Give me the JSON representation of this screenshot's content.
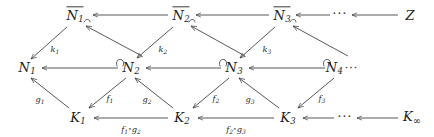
{
  "diagram": {
    "kind": "commutative-diagram",
    "stroke_color": "#3a3a3a",
    "text_color": "#1c1c1c",
    "background": "#ffffff",
    "ellipsis": "···",
    "trailing_ellipsis": "···",
    "compose_symbol": "∘"
  },
  "nodes": {
    "top": [
      {
        "base": "N",
        "sub": "1",
        "overline": true,
        "x": 75,
        "y": 15
      },
      {
        "base": "N",
        "sub": "2",
        "overline": true,
        "x": 181,
        "y": 15
      },
      {
        "base": "N",
        "sub": "3",
        "overline": true,
        "x": 282,
        "y": 15
      },
      {
        "base": "Z",
        "sub": "",
        "overline": false,
        "x": 410,
        "y": 15
      }
    ],
    "middle": [
      {
        "base": "N",
        "sub": "1",
        "x": 27,
        "y": 68
      },
      {
        "base": "N",
        "sub": "2",
        "x": 131,
        "y": 68
      },
      {
        "base": "N",
        "sub": "3",
        "x": 234,
        "y": 68
      },
      {
        "base": "N",
        "sub": "4",
        "x": 338,
        "y": 68
      }
    ],
    "bottom": [
      {
        "base": "K",
        "sub": "1",
        "x": 78,
        "y": 118
      },
      {
        "base": "K",
        "sub": "2",
        "x": 182,
        "y": 118
      },
      {
        "base": "K",
        "sub": "3",
        "x": 288,
        "y": 118
      },
      {
        "base": "K",
        "sub": "∞",
        "x": 412,
        "y": 118
      }
    ]
  },
  "labels": {
    "k1": {
      "base": "k",
      "sub": "1",
      "x": 55,
      "y": 50
    },
    "k2": {
      "base": "k",
      "sub": "2",
      "x": 163,
      "y": 50
    },
    "k3": {
      "base": "k",
      "sub": "3",
      "x": 267,
      "y": 50
    },
    "g1": {
      "base": "g",
      "sub": "1",
      "x": 40,
      "y": 100
    },
    "f1": {
      "base": "f",
      "sub": "1",
      "x": 110,
      "y": 99
    },
    "g2": {
      "base": "g",
      "sub": "2",
      "x": 147,
      "y": 100
    },
    "f2": {
      "base": "f",
      "sub": "2",
      "x": 216,
      "y": 99
    },
    "g3": {
      "base": "g",
      "sub": "3",
      "x": 250,
      "y": 100
    },
    "f3": {
      "base": "f",
      "sub": "3",
      "x": 322,
      "y": 99
    },
    "comp1": {
      "left_base": "f",
      "left_sub": "1",
      "right_base": "g",
      "right_sub": "2",
      "x": 131,
      "y": 130
    },
    "comp2": {
      "left_base": "f",
      "left_sub": "2",
      "right_base": "g",
      "right_sub": "3",
      "x": 236,
      "y": 130
    }
  },
  "ellipses": {
    "top_row": {
      "text": "···",
      "x": 340,
      "y": 14
    },
    "middle_row_trailing": {
      "text": "···"
    },
    "bottom_row": {
      "text": "···",
      "x": 345,
      "y": 117
    }
  }
}
